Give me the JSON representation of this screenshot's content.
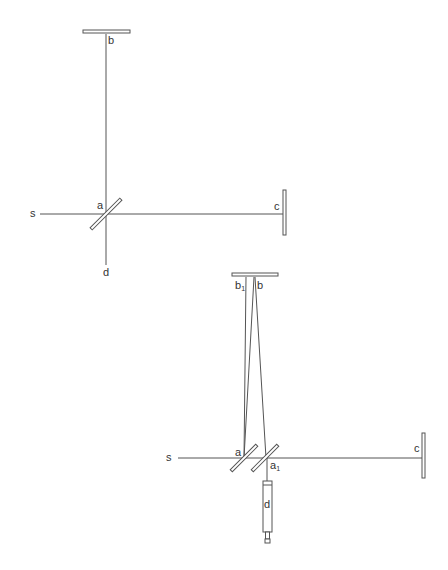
{
  "diagram_upper": {
    "title": "Michelson interferometer (basic)",
    "labels": {
      "source": "s",
      "beamsplitter": "a",
      "mirror_top": "b",
      "mirror_right": "c",
      "detector": "d"
    }
  },
  "diagram_lower": {
    "title": "Michelson interferometer with compensator and telescope",
    "labels": {
      "source": "s",
      "beamsplitter": "a",
      "compensator": "a",
      "compensator_sub": "1",
      "mirror_top_left": "b",
      "mirror_top_left_sub": "1",
      "mirror_top_right": "b",
      "mirror_right": "c",
      "telescope": "d"
    }
  },
  "colors": {
    "line": "#555555",
    "mirror_fill": "#ffffff",
    "text": "#333333"
  }
}
